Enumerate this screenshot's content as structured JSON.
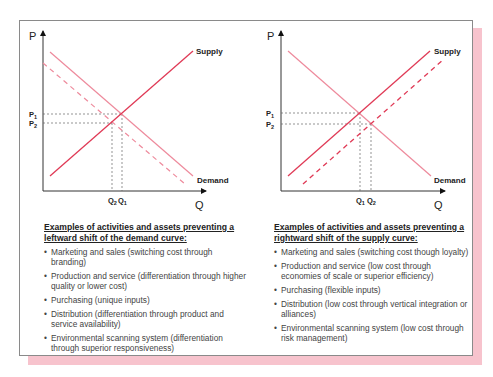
{
  "colors": {
    "supply": "#e03a56",
    "demand": "#ee8a9c",
    "dashed_shift": "#ee8a9c",
    "guide": "#555555",
    "shadow": "#f7c3cd",
    "frame": "#8a8a8a"
  },
  "left_panel": {
    "axis_p_label": "P",
    "axis_q_label": "Q",
    "supply_label": "Supply",
    "demand_label": "Demand",
    "p1_label": "P",
    "p1_sub": "1",
    "p2_label": "P",
    "p2_sub": "2",
    "q_first_label": "Q",
    "q_first_sub": "2",
    "q_second_label": "Q",
    "q_second_sub": "1",
    "heading": "Examples of activities and assets preventing a leftward shift of the demand curve:",
    "bullets": [
      "Marketing and sales (switching cost through branding)",
      "Production and service (differentiation through higher quality or lower cost)",
      "Purchasing (unique inputs)",
      "Distribution (differentiation through product and service availability)",
      "Environmental scanning system (differentiation through superior responsiveness)"
    ]
  },
  "right_panel": {
    "axis_p_label": "P",
    "axis_q_label": "Q",
    "supply_label": "Supply",
    "demand_label": "Demand",
    "p1_label": "P",
    "p1_sub": "1",
    "p2_label": "P",
    "p2_sub": "2",
    "q_first_label": "Q",
    "q_first_sub": "1",
    "q_second_label": "Q",
    "q_second_sub": "2",
    "heading": "Examples of activities and assets preventing a rightward shift of the supply curve:",
    "bullets": [
      "Marketing and sales (switching cost though loyalty)",
      "Production and service (low cost through economies of scale or superior efficiency)",
      "Purchasing (flexible inputs)",
      "Distribution (low cost through vertical integration or alliances)",
      "Environmental scanning system (low cost through risk management)"
    ]
  },
  "bullet_glyph": "•"
}
